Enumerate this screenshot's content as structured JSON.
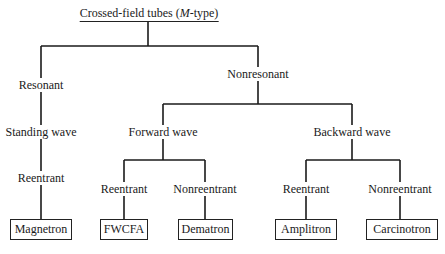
{
  "diagram": {
    "title_prefix": "Crossed-field tubes (",
    "title_italic": "M",
    "title_suffix": "-type)",
    "nodes": {
      "resonant": "Resonant",
      "standing_wave": "Standing wave",
      "reentrant_left": "Reentrant",
      "nonresonant": "Nonresonant",
      "forward_wave": "Forward wave",
      "backward_wave": "Backward wave",
      "fw_reentrant": "Reentrant",
      "fw_nonreentrant": "Nonreentrant",
      "bw_reentrant": "Reentrant",
      "bw_nonreentrant": "Nonreentrant"
    },
    "leaves": {
      "magnetron": "Magnetron",
      "fwcfa": "FWCFA",
      "dematron": "Dematron",
      "amplitron": "Amplitron",
      "carcinotron": "Carcinotron"
    },
    "line_color": "#1a1a1a"
  }
}
